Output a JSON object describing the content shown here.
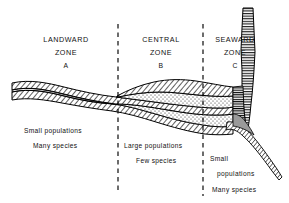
{
  "figure": {
    "background_color": "#ffffff",
    "line_color": "#000000"
  },
  "zones": [
    {
      "id": "landward",
      "name_line1": "LANDWARD",
      "name_line2": "ZONE",
      "letter": "A",
      "notes": [
        "Small  populations",
        "Many  species"
      ]
    },
    {
      "id": "central",
      "name_line1": "CENTRAL",
      "name_line2": "ZONE",
      "letter": "B",
      "notes": [
        "Large  populations",
        "Few  species"
      ]
    },
    {
      "id": "seaward",
      "name_line1": "SEAWARD",
      "name_line2": "ZONE",
      "letter": "C",
      "notes": [
        "Small",
        "populations",
        "Many  species"
      ]
    }
  ],
  "dividers": [
    {
      "id": "divider-a-b",
      "x": 118,
      "y_top": 24,
      "y_bottom": 190
    },
    {
      "id": "divider-b-c",
      "x": 203,
      "y_top": 24,
      "y_bottom": 196
    }
  ],
  "strata": {
    "hatch_pattern": "diagonal-hatch",
    "stipple_pattern": "dotted-stipple",
    "horizontal_pattern": "horizontal-line-hatch",
    "layers": [
      {
        "id": "upper-hatched-bed",
        "pattern": "diagonal-hatch"
      },
      {
        "id": "upper-stippled-bed",
        "pattern": "dotted-stipple"
      },
      {
        "id": "middle-hatched-bed",
        "pattern": "diagonal-hatch"
      },
      {
        "id": "lower-stippled-bed",
        "pattern": "dotted-stipple"
      },
      {
        "id": "lower-hatched-bed",
        "pattern": "diagonal-hatch"
      },
      {
        "id": "seaward-vertical-column",
        "pattern": "horizontal-line-hatch"
      },
      {
        "id": "seaward-descending-band",
        "pattern": "diagonal-hatch"
      }
    ]
  }
}
